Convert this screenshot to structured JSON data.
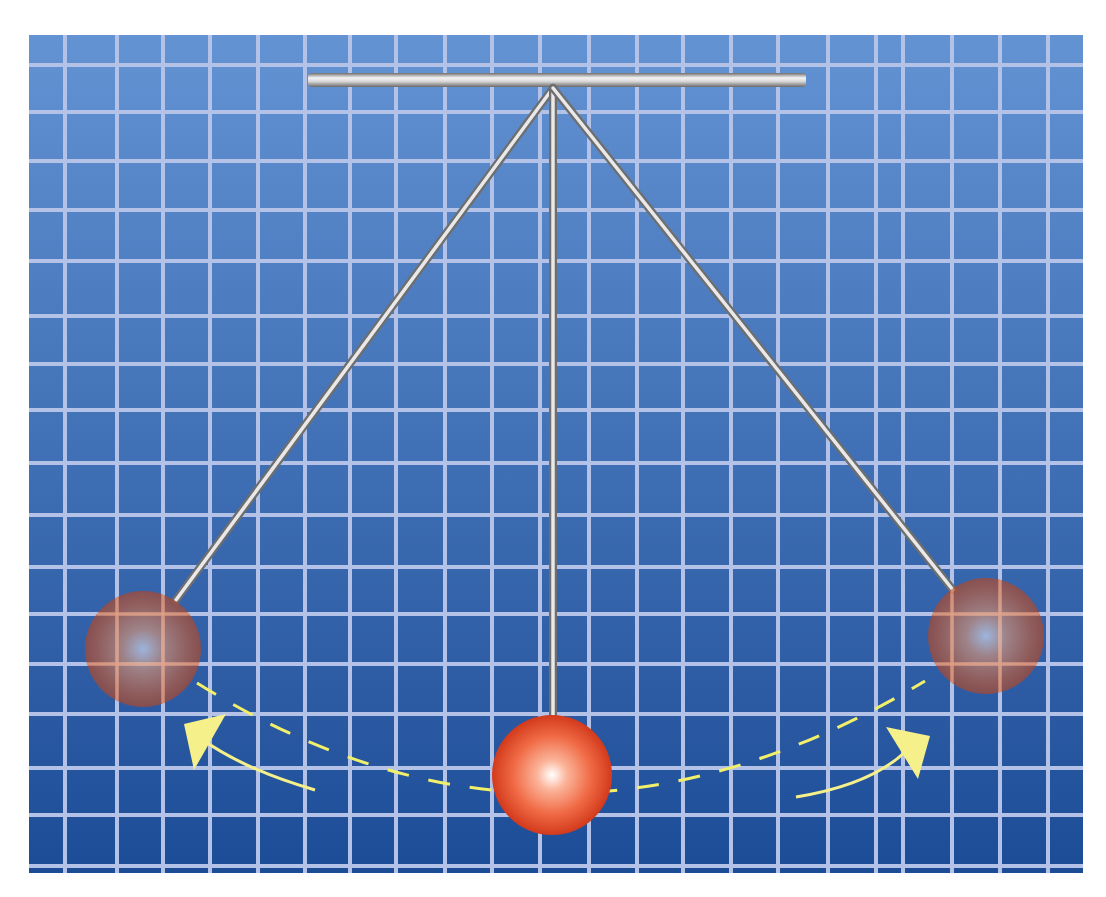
{
  "canvas": {
    "width": 1106,
    "height": 897,
    "background": "#ffffff"
  },
  "panel": {
    "x": 29,
    "y": 35,
    "width": 1054,
    "height": 838,
    "gradient_top": "#6393d3",
    "gradient_bottom": "#1d4c97",
    "grid_color": "#b3c2e6",
    "grid_width": 4,
    "grid_x": [
      65,
      117,
      163,
      210,
      258,
      305,
      350,
      396,
      445,
      492,
      540,
      589,
      637,
      683,
      731,
      778,
      828,
      876,
      903,
      952,
      1000,
      1048
    ],
    "grid_y": [
      65,
      112,
      161,
      210,
      261,
      316,
      364,
      410,
      463,
      515,
      567,
      614,
      664,
      714,
      768,
      815,
      866
    ]
  },
  "support_bar": {
    "x1": 308,
    "x2": 806,
    "y": 80,
    "thickness": 14,
    "color_light": "#f2f2f2",
    "color_dark": "#7c7c7c"
  },
  "pivot": {
    "x": 553,
    "y": 88
  },
  "rods": [
    {
      "name": "left-rod",
      "x2": 176,
      "y2": 600
    },
    {
      "name": "center-rod",
      "x2": 553,
      "y2": 716
    },
    {
      "name": "right-rod",
      "x2": 953,
      "y2": 590
    }
  ],
  "balls": [
    {
      "name": "left-bob",
      "cx": 143,
      "cy": 649,
      "r": 58,
      "opacity": 0.72,
      "state": "extreme-left"
    },
    {
      "name": "center-bob",
      "cx": 552,
      "cy": 775,
      "r": 60,
      "opacity": 1,
      "state": "equilibrium"
    },
    {
      "name": "right-bob",
      "cx": 986,
      "cy": 636,
      "r": 58,
      "opacity": 0.72,
      "state": "extreme-right"
    }
  ],
  "ball_colors": {
    "highlight": "#ffffff",
    "mid": "#f47a55",
    "edge": "#d23a1c"
  },
  "path": {
    "color": "#f2ef6a",
    "dash": "22 20",
    "d": "M 197 683 Q 552 905 925 681"
  },
  "arrows": [
    {
      "name": "arrow-left",
      "curve": "M 315 790 Q 245 770 200 738",
      "head": "184,724 226,714 194,770"
    },
    {
      "name": "arrow-right",
      "curve": "M 796 797 Q 870 785 905 752",
      "head": "886,727 930,736 918,779"
    }
  ],
  "arrow_color": "#f6f08a"
}
